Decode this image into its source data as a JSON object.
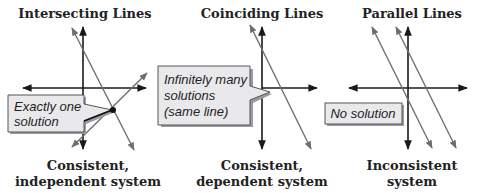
{
  "panels": [
    {
      "title": "Intersecting Lines",
      "callout_lines": [
        "Exactly one",
        "solution"
      ],
      "caption_lines": [
        "Consistent,",
        "independent system"
      ]
    },
    {
      "title": "Coinciding Lines",
      "callout_lines": [
        "Infinitely many",
        "solutions",
        "(same line)"
      ],
      "caption_lines": [
        "Consistent,",
        "dependent system"
      ]
    },
    {
      "title": "Parallel Lines",
      "callout_lines": [
        "No solution"
      ],
      "caption_lines": [
        "Inconsistent",
        "system"
      ]
    }
  ],
  "colors": {
    "axis": "#1a1a1a",
    "line": "#6e6e78",
    "callout_fill": "#e9e9ec",
    "text": "#222222"
  }
}
